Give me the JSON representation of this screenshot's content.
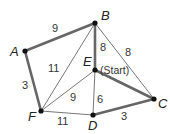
{
  "diagram": {
    "type": "weighted-graph",
    "colors": {
      "thick_edge": "#666666",
      "thin_edge": "#777777",
      "node": "#111111",
      "text": "#222222"
    },
    "vertices": [
      {
        "id": "A",
        "label": "A",
        "x": 25,
        "y": 51,
        "lx": 10,
        "ly": 56
      },
      {
        "id": "B",
        "label": "B",
        "x": 95,
        "y": 23,
        "lx": 101,
        "ly": 20
      },
      {
        "id": "E",
        "label": "E",
        "x": 95,
        "y": 70,
        "lx": 83,
        "ly": 66
      },
      {
        "id": "C",
        "label": "C",
        "x": 154,
        "y": 99,
        "lx": 158,
        "ly": 108
      },
      {
        "id": "F",
        "label": "F",
        "x": 41,
        "y": 111,
        "lx": 28,
        "ly": 121
      },
      {
        "id": "D",
        "label": "D",
        "x": 93,
        "y": 115,
        "lx": 88,
        "ly": 130
      }
    ],
    "start_label": "(Start)",
    "edges": [
      {
        "from": "A",
        "to": "B",
        "weight": "9",
        "thick": true,
        "wx": 52,
        "wy": 32
      },
      {
        "from": "A",
        "to": "F",
        "weight": "3",
        "thick": true,
        "wx": 22,
        "wy": 89
      },
      {
        "from": "B",
        "to": "E",
        "weight": "8",
        "thick": true,
        "wx": 100,
        "wy": 51
      },
      {
        "from": "B",
        "to": "C",
        "weight": "8",
        "thick": false,
        "wx": 125,
        "wy": 56
      },
      {
        "from": "F",
        "to": "B",
        "weight": "11",
        "thick": false,
        "wx": 48,
        "wy": 72
      },
      {
        "from": "E",
        "to": "C",
        "weight": "",
        "thick": true,
        "wx": 0,
        "wy": 0
      },
      {
        "from": "F",
        "to": "E",
        "weight": "9",
        "thick": false,
        "wx": 70,
        "wy": 101
      },
      {
        "from": "E",
        "to": "D",
        "weight": "6",
        "thick": false,
        "wx": 97,
        "wy": 103
      },
      {
        "from": "F",
        "to": "D",
        "weight": "11",
        "thick": false,
        "wx": 57,
        "wy": 125
      },
      {
        "from": "D",
        "to": "C",
        "weight": "3",
        "thick": true,
        "wx": 121,
        "wy": 120
      }
    ]
  }
}
